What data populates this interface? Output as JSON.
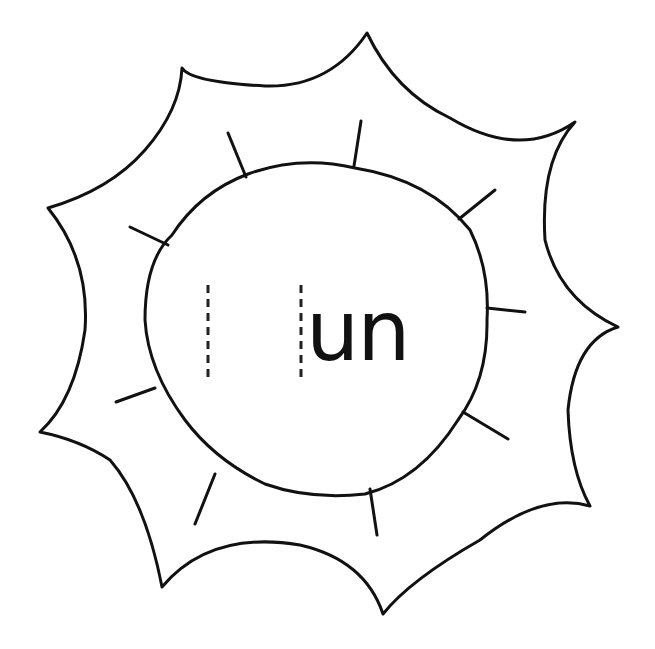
{
  "worksheet": {
    "type": "word family sun",
    "word_family": "un",
    "blank_count": 1,
    "colors": {
      "ink": "#111111",
      "paper": "#ffffff"
    }
  }
}
